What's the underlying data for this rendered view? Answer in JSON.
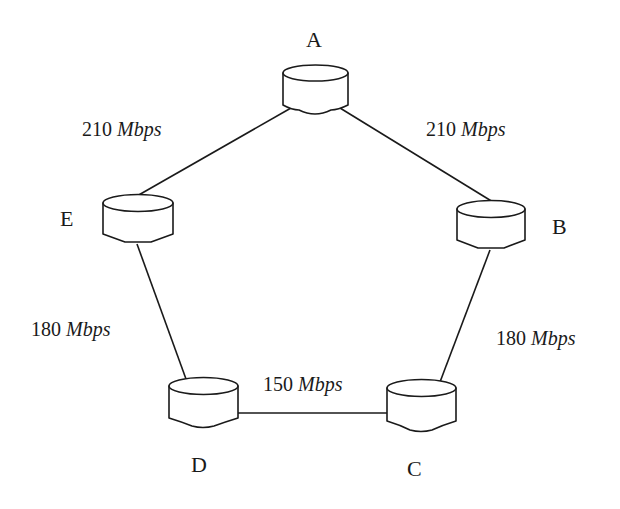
{
  "diagram": {
    "type": "network-topology",
    "nodes": [
      {
        "id": "A",
        "label": "A",
        "x": 315,
        "y": 65,
        "w": 65,
        "label_x": 315,
        "label_y": 46
      },
      {
        "id": "B",
        "label": "B",
        "x": 491,
        "y": 201,
        "w": 68,
        "label_x": 560,
        "label_y": 234
      },
      {
        "id": "C",
        "label": "C",
        "x": 421,
        "y": 380,
        "w": 69,
        "label_x": 415,
        "label_y": 476
      },
      {
        "id": "D",
        "label": "D",
        "x": 203,
        "y": 378,
        "w": 69,
        "label_x": 200,
        "label_y": 472
      },
      {
        "id": "E",
        "label": "E",
        "x": 138,
        "y": 195,
        "w": 70,
        "label_x": 68,
        "label_y": 226
      }
    ],
    "links": [
      {
        "from": "A",
        "to": "E",
        "bandwidth": "210",
        "unit": "Mbps",
        "label_x": 80,
        "label_y": 136
      },
      {
        "from": "A",
        "to": "B",
        "bandwidth": "210",
        "unit": "Mbps",
        "label_x": 425,
        "label_y": 136
      },
      {
        "from": "E",
        "to": "D",
        "bandwidth": "180",
        "unit": "Mbps",
        "label_x": 30,
        "label_y": 336
      },
      {
        "from": "B",
        "to": "C",
        "bandwidth": "180",
        "unit": "Mbps",
        "label_x": 495,
        "label_y": 345
      },
      {
        "from": "D",
        "to": "C",
        "bandwidth": "150",
        "unit": "Mbps",
        "label_x": 262,
        "label_y": 391
      }
    ]
  },
  "labels": {
    "node_a": "A",
    "node_b": "B",
    "node_c": "C",
    "node_d": "D",
    "node_e": "E",
    "link_ae_bw": "210",
    "link_ab_bw": "210",
    "link_ed_bw": "180",
    "link_bc_bw": "180",
    "link_dc_bw": "150",
    "unit": "Mbps"
  },
  "colors": {
    "stroke": "#1a1a1a",
    "background": "#ffffff"
  }
}
